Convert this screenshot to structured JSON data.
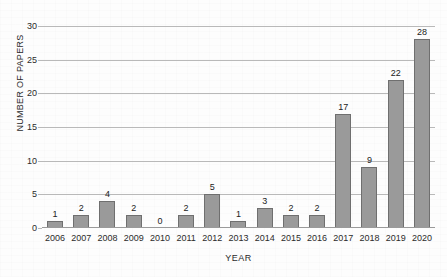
{
  "chart_data": {
    "type": "bar",
    "title": "",
    "xlabel": "YEAR",
    "ylabel": "NUMBER OF PAPERS",
    "categories": [
      "2006",
      "2007",
      "2008",
      "2009",
      "2010",
      "2011",
      "2012",
      "2013",
      "2014",
      "2015",
      "2016",
      "2017",
      "2018",
      "2019",
      "2020"
    ],
    "values": [
      1,
      2,
      4,
      2,
      0,
      2,
      5,
      1,
      3,
      2,
      2,
      17,
      9,
      22,
      28
    ],
    "data_labels": [
      "1",
      "2",
      "4",
      "2",
      "0",
      "2",
      "5",
      "1",
      "3",
      "2",
      "2",
      "17",
      "9",
      "22",
      "28"
    ],
    "ylim": [
      0,
      30
    ],
    "y_ticks": [
      0,
      5,
      10,
      15,
      20,
      25,
      30
    ],
    "y_tick_labels": [
      "0",
      "5",
      "10",
      "15",
      "20",
      "25",
      "30"
    ],
    "grid": true,
    "legend": null,
    "bar_fill_color": "#9a9a9a",
    "bar_edge_color": "#6f6f6f",
    "gridline_color": "#b9b9b9",
    "text_color": "#2b2b2b",
    "background_color": "#fdfdfd"
  }
}
